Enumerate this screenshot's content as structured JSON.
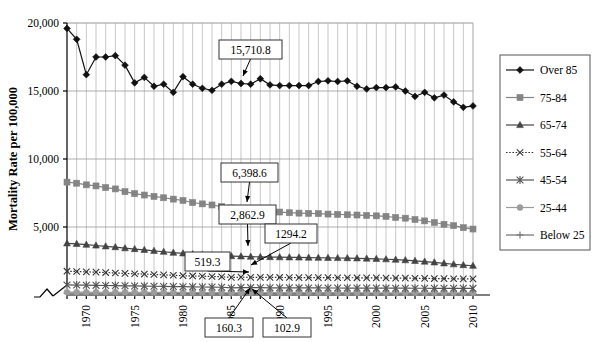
{
  "chart_data": {
    "type": "line",
    "title": "",
    "xlabel": "",
    "ylabel": "Mortality Rate per 100,000",
    "ylim": [
      0,
      20000
    ],
    "yticks": [
      5000,
      10000,
      15000,
      20000
    ],
    "ytick_labels": [
      "5,000",
      "10,000",
      "15,000",
      "20,000"
    ],
    "xlim": [
      1968,
      2010
    ],
    "xticks": [
      1970,
      1975,
      1980,
      1985,
      1990,
      1995,
      2000,
      2005,
      2010
    ],
    "xtick_labels": [
      "1970",
      "1975",
      "1980",
      "1985",
      "1990",
      "1995",
      "2000",
      "2005",
      "2010"
    ],
    "grid": "both",
    "axis_break": true,
    "legend_position": "right",
    "x": [
      1968,
      1969,
      1970,
      1971,
      1972,
      1973,
      1974,
      1975,
      1976,
      1977,
      1978,
      1979,
      1980,
      1981,
      1982,
      1983,
      1984,
      1985,
      1986,
      1987,
      1988,
      1989,
      1990,
      1991,
      1992,
      1993,
      1994,
      1995,
      1996,
      1997,
      1998,
      1999,
      2000,
      2001,
      2002,
      2003,
      2004,
      2005,
      2006,
      2007,
      2008,
      2009,
      2010
    ],
    "series": [
      {
        "name": "Over 85",
        "marker": "diamond",
        "color": "#111111",
        "dash": "none",
        "values": [
          19600,
          18800,
          16200,
          17500,
          17500,
          17600,
          16900,
          15600,
          16000,
          15350,
          15500,
          14900,
          16050,
          15500,
          15200,
          15050,
          15500,
          15710.8,
          15550,
          15500,
          15900,
          15450,
          15400,
          15400,
          15400,
          15400,
          15700,
          15750,
          15700,
          15750,
          15350,
          15150,
          15250,
          15250,
          15300,
          15000,
          14600,
          14900,
          14500,
          14700,
          14200,
          13800,
          13900
        ]
      },
      {
        "name": "75-84",
        "marker": "square",
        "color": "#848484",
        "dash": "none",
        "values": [
          8300,
          8220,
          8100,
          8020,
          7900,
          7800,
          7600,
          7450,
          7350,
          7250,
          7150,
          7050,
          6950,
          6800,
          6700,
          6620,
          6500,
          6398.6,
          6320,
          6250,
          6200,
          6150,
          6100,
          6050,
          6020,
          6000,
          5980,
          5950,
          5930,
          5900,
          5880,
          5850,
          5820,
          5780,
          5700,
          5650,
          5550,
          5450,
          5330,
          5200,
          5100,
          4950,
          4850
        ]
      },
      {
        "name": "65-74",
        "marker": "triangle",
        "color": "#444444",
        "dash": "none",
        "values": [
          3800,
          3760,
          3700,
          3640,
          3580,
          3520,
          3440,
          3380,
          3320,
          3250,
          3180,
          3110,
          3060,
          3000,
          2960,
          2920,
          2890,
          2862.9,
          2840,
          2820,
          2800,
          2790,
          2780,
          2770,
          2760,
          2750,
          2740,
          2730,
          2720,
          2710,
          2700,
          2680,
          2660,
          2630,
          2600,
          2560,
          2510,
          2460,
          2400,
          2330,
          2260,
          2200,
          2150
        ]
      },
      {
        "name": "55-64",
        "marker": "x-thin",
        "color": "#333333",
        "dash": "dotted",
        "values": [
          1750,
          1730,
          1700,
          1680,
          1650,
          1620,
          1590,
          1560,
          1540,
          1510,
          1480,
          1450,
          1420,
          1400,
          1380,
          1360,
          1340,
          1294.2,
          1310,
          1300,
          1300,
          1295,
          1290,
          1285,
          1280,
          1280,
          1280,
          1275,
          1270,
          1270,
          1265,
          1260,
          1255,
          1250,
          1245,
          1240,
          1230,
          1220,
          1210,
          1200,
          1195,
          1190,
          1185
        ]
      },
      {
        "name": "45-54",
        "marker": "star",
        "color": "#555555",
        "dash": "none",
        "values": [
          740,
          730,
          720,
          710,
          700,
          690,
          675,
          665,
          655,
          645,
          630,
          620,
          610,
          600,
          590,
          580,
          570,
          519.3,
          545,
          540,
          535,
          530,
          528,
          525,
          522,
          520,
          518,
          516,
          514,
          512,
          510,
          508,
          506,
          504,
          502,
          500,
          498,
          496,
          494,
          492,
          490,
          488,
          486
        ]
      },
      {
        "name": "25-44",
        "marker": "circle",
        "color": "#9c9c9c",
        "dash": "none",
        "values": [
          210,
          208,
          206,
          204,
          202,
          200,
          198,
          196,
          194,
          192,
          190,
          188,
          186,
          184,
          182,
          180,
          178,
          160.3,
          174,
          172,
          172,
          172,
          174,
          176,
          178,
          178,
          176,
          174,
          172,
          170,
          168,
          166,
          164,
          162,
          162,
          162,
          162,
          162,
          162,
          162,
          162,
          162,
          162
        ]
      },
      {
        "name": "Below 25",
        "marker": "plus",
        "color": "#6e6e6e",
        "dash": "none",
        "values": [
          135,
          134,
          133,
          132,
          131,
          130,
          129,
          128,
          127,
          126,
          125,
          124,
          123,
          122,
          121,
          120,
          119,
          102.9,
          117,
          116,
          115,
          114,
          113,
          112,
          111,
          110,
          110,
          109,
          109,
          108,
          108,
          107,
          107,
          106,
          106,
          105,
          105,
          104,
          104,
          103,
          103,
          102,
          102
        ]
      }
    ],
    "annotations": [
      {
        "label": "15,710.8",
        "series": "Over 85",
        "x": 1985,
        "y": 15710.8,
        "box_x": 219,
        "box_y": 40,
        "box_w": 63,
        "box_h": 19,
        "tip_x": 243,
        "tip_y": 76
      },
      {
        "label": "6,398.6",
        "series": "75-84",
        "x": 1985,
        "y": 6398.6,
        "box_x": 221,
        "box_y": 163,
        "box_w": 57,
        "box_h": 19,
        "tip_x": 247,
        "tip_y": 202
      },
      {
        "label": "2,862.9",
        "series": "65-74",
        "x": 1985,
        "y": 2862.9,
        "box_x": 219,
        "box_y": 205,
        "box_w": 57,
        "box_h": 19,
        "tip_x": 248,
        "tip_y": 246
      },
      {
        "label": "1294.2",
        "series": "55-64",
        "x": 1985,
        "y": 1294.2,
        "box_x": 265,
        "box_y": 224,
        "box_w": 52,
        "box_h": 19,
        "tip_x": 251,
        "tip_y": 265
      },
      {
        "label": "519.3",
        "series": "45-54",
        "x": 1985,
        "y": 519.3,
        "box_x": 185,
        "box_y": 252,
        "box_w": 45,
        "box_h": 19,
        "tip_x": 249,
        "tip_y": 272
      },
      {
        "label": "160.3",
        "series": "25-44",
        "x": 1985,
        "y": 160.3,
        "box_x": 205,
        "box_y": 318,
        "box_w": 48,
        "box_h": 19,
        "tip_x": 250,
        "tip_y": 288
      },
      {
        "label": "102.9",
        "series": "Below 25",
        "x": 1985,
        "y": 102.9,
        "box_x": 263,
        "box_y": 318,
        "box_w": 48,
        "box_h": 19,
        "tip_x": 252,
        "tip_y": 289
      }
    ]
  },
  "legend": {
    "items": [
      {
        "label": "Over 85",
        "marker": "diamond",
        "color": "#111111",
        "dash": "none"
      },
      {
        "label": "75-84",
        "marker": "square",
        "color": "#848484",
        "dash": "none"
      },
      {
        "label": "65-74",
        "marker": "triangle",
        "color": "#444444",
        "dash": "none"
      },
      {
        "label": "55-64",
        "marker": "x-thin",
        "color": "#333333",
        "dash": "dotted"
      },
      {
        "label": "45-54",
        "marker": "star",
        "color": "#555555",
        "dash": "none"
      },
      {
        "label": "25-44",
        "marker": "circle",
        "color": "#9c9c9c",
        "dash": "none"
      },
      {
        "label": "Below 25",
        "marker": "plus",
        "color": "#6e6e6e",
        "dash": "none"
      }
    ]
  },
  "colors": {
    "grid_vertical": "#b9b9b9",
    "grid_horizontal": "#9a9a9a",
    "axis": "#000000",
    "background": "#ffffff"
  }
}
